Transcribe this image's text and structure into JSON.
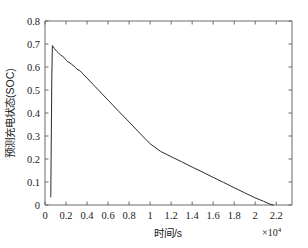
{
  "chart_data": {
    "type": "line",
    "title": "",
    "xlabel": "时间/s",
    "ylabel": "预测充电状态(SOC)",
    "x_multiplier_label": "×10",
    "x_multiplier_exponent": "4",
    "x_multiplier_value": 10000,
    "xlim": [
      0,
      2.35
    ],
    "ylim": [
      0,
      0.8
    ],
    "grid": false,
    "legend": null,
    "x_tick_labels": [
      "0",
      "0.2",
      "0.4",
      "0.6",
      "0.8",
      "1",
      "1.2",
      "1.4",
      "1.6",
      "1.8",
      "2",
      "2.2"
    ],
    "x_tick_values": [
      0,
      0.2,
      0.4,
      0.6,
      0.8,
      1,
      1.2,
      1.4,
      1.6,
      1.8,
      2,
      2.2
    ],
    "y_tick_labels": [
      "0",
      "0.1",
      "0.2",
      "0.3",
      "0.4",
      "0.5",
      "0.6",
      "0.7",
      "0.8"
    ],
    "y_tick_values": [
      0,
      0.1,
      0.2,
      0.3,
      0.4,
      0.5,
      0.6,
      0.7,
      0.8
    ],
    "line_color": "#2b2b2b",
    "axis_color": "#6b6b6b",
    "background_color": "#ffffff",
    "series": [
      {
        "name": "预测充电状态(SOC)",
        "x": [
          0.055,
          0.06,
          0.065,
          0.07,
          0.075,
          0.09,
          0.11,
          0.13,
          0.15,
          0.17,
          0.19,
          0.205,
          0.215,
          0.23,
          0.25,
          0.27,
          0.29,
          0.305,
          0.315,
          0.33,
          0.345,
          0.36,
          0.38,
          0.4,
          0.43,
          0.46,
          0.5,
          0.55,
          0.6,
          0.7,
          0.8,
          0.9,
          1.0,
          1.1,
          1.2,
          1.3,
          1.4,
          1.5,
          1.6,
          1.7,
          1.8,
          1.9,
          2.0,
          2.08,
          2.14,
          2.17
        ],
        "y": [
          0.035,
          0.3,
          0.56,
          0.693,
          0.69,
          0.68,
          0.669,
          0.66,
          0.652,
          0.645,
          0.637,
          0.628,
          0.623,
          0.62,
          0.613,
          0.606,
          0.598,
          0.59,
          0.588,
          0.585,
          0.578,
          0.57,
          0.561,
          0.552,
          0.537,
          0.523,
          0.504,
          0.48,
          0.456,
          0.408,
          0.361,
          0.313,
          0.266,
          0.233,
          0.21,
          0.188,
          0.165,
          0.143,
          0.12,
          0.098,
          0.075,
          0.053,
          0.031,
          0.016,
          0.004,
          0.0
        ]
      }
    ]
  }
}
